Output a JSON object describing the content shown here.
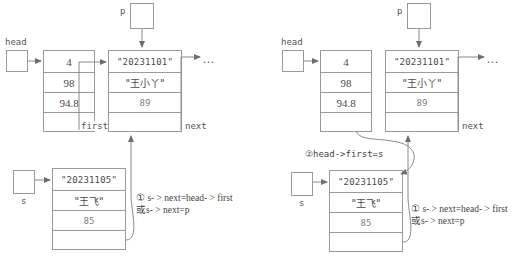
{
  "diagram": {
    "stroke_color": "#9a9a9a",
    "text_color": "#4a4a4a"
  },
  "labels": {
    "head": "head",
    "p": "p",
    "s": "s",
    "first_field": "first",
    "next_field": "next",
    "ellipsis": "..."
  },
  "nodes": {
    "head_node": {
      "name": "head-node",
      "cells": [
        "4",
        "98",
        "94.8",
        ""
      ]
    },
    "p_node": {
      "name": "p-node",
      "cells": [
        "\"20231101\"",
        "\"王小丫\"",
        "89",
        ""
      ]
    },
    "s_node": {
      "name": "s-node",
      "cells": [
        "\"20231105\"",
        "\"王飞\"",
        "85",
        ""
      ]
    }
  },
  "annotations": {
    "step1_line1": "① s- > next=head- > first",
    "step1_line2": "或s- > next=p",
    "step2": "②head->first=s"
  }
}
